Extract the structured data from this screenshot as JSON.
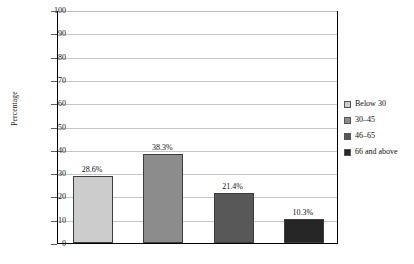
{
  "chart_data": {
    "type": "bar",
    "title": "",
    "subtitle": "",
    "xlabel": "",
    "ylabel": "Percentage",
    "ylim": [
      0,
      100
    ],
    "ytick_step": 10,
    "ytick_labels": [
      "100",
      "90",
      "80",
      "70",
      "60",
      "50",
      "40",
      "30",
      "20",
      "10",
      "0"
    ],
    "grid": true,
    "xtick_labels": [],
    "legend_position": "right",
    "categories": [
      "Below 30",
      "30–45",
      "46–65",
      "66 and above"
    ],
    "values": [
      28.6,
      38.3,
      21.4,
      10.3
    ],
    "data_labels": [
      "28.6%",
      "38.3%",
      "21.4%",
      "10.3%"
    ],
    "colors": [
      "#cccccc",
      "#8c8c8c",
      "#585858",
      "#262626"
    ],
    "legend": [
      {
        "label": "Below 30",
        "color": "#cccccc"
      },
      {
        "label": "30–45",
        "color": "#8c8c8c"
      },
      {
        "label": "46–65",
        "color": "#585858"
      },
      {
        "label": "66 and above",
        "color": "#262626"
      }
    ]
  }
}
